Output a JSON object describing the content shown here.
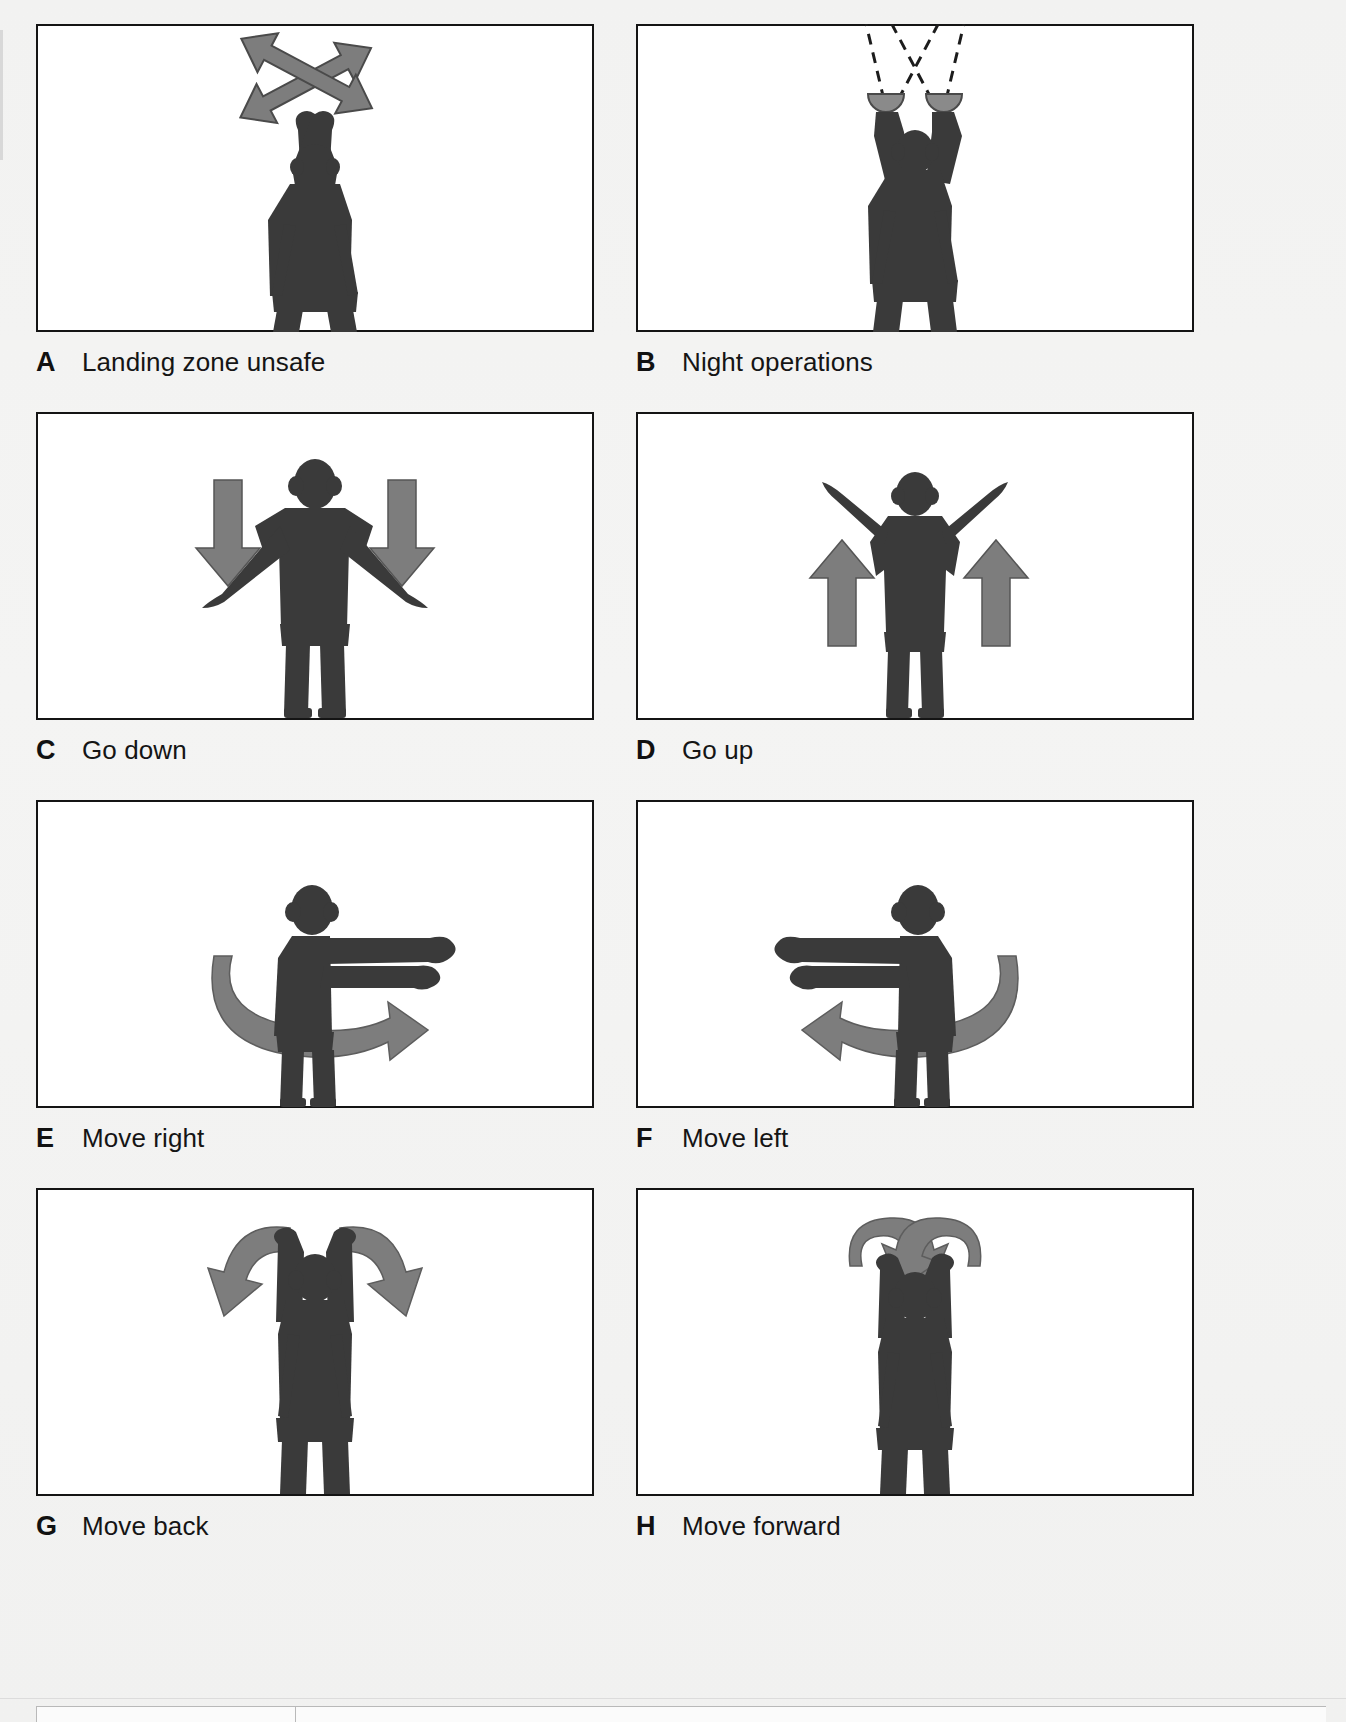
{
  "figure": {
    "background_color": "#f2f2f1",
    "frame_color": "#141414",
    "figure_fill_color": "#3a3a3a",
    "arrow_fill_color": "#7d7d7d",
    "panel_count": 8
  },
  "panels": [
    {
      "id": "A",
      "letter": "A",
      "label": "Landing zone unsafe",
      "signal_name": "landing-zone-unsafe",
      "pose": "Both arms raised overhead, wrists crossed above the head",
      "annotation": "Two crossed double-headed gray arrows above the head indicating waving arms back and forth"
    },
    {
      "id": "B",
      "letter": "B",
      "label": "Night operations",
      "signal_name": "night-operations",
      "pose": "Both arms raised overhead holding illuminated wands",
      "annotation": "Dashed light beams projecting upward and crossing from two lighted wands"
    },
    {
      "id": "C",
      "letter": "C",
      "label": "Go down",
      "signal_name": "go-down",
      "pose": "Arms extended out to the sides and angled downward",
      "annotation": "Two gray arrows pointing down, one on each side"
    },
    {
      "id": "D",
      "letter": "D",
      "label": "Go up",
      "signal_name": "go-up",
      "pose": "Arms extended out to the sides and angled upward",
      "annotation": "Two gray arrows pointing up, one on each side"
    },
    {
      "id": "E",
      "letter": "E",
      "label": "Move right",
      "signal_name": "move-right",
      "pose": "Both arms extended horizontally toward the viewer's right",
      "annotation": "Gray curved sweep arrow wrapping the torso pointing to the right"
    },
    {
      "id": "F",
      "letter": "F",
      "label": "Move left",
      "signal_name": "move-left",
      "pose": "Both arms extended horizontally toward the viewer's left",
      "annotation": "Gray curved sweep arrow wrapping the torso pointing to the left"
    },
    {
      "id": "G",
      "letter": "G",
      "label": "Move back",
      "signal_name": "move-back",
      "pose": "Both arms raised overhead with hands up",
      "annotation": "Two gray curved arrows arcing outward and downward away from the body"
    },
    {
      "id": "H",
      "letter": "H",
      "label": "Move forward",
      "signal_name": "move-forward",
      "pose": "Both arms raised overhead with hands up",
      "annotation": "Two gray curved arrows arcing inward and downward toward the body"
    }
  ]
}
